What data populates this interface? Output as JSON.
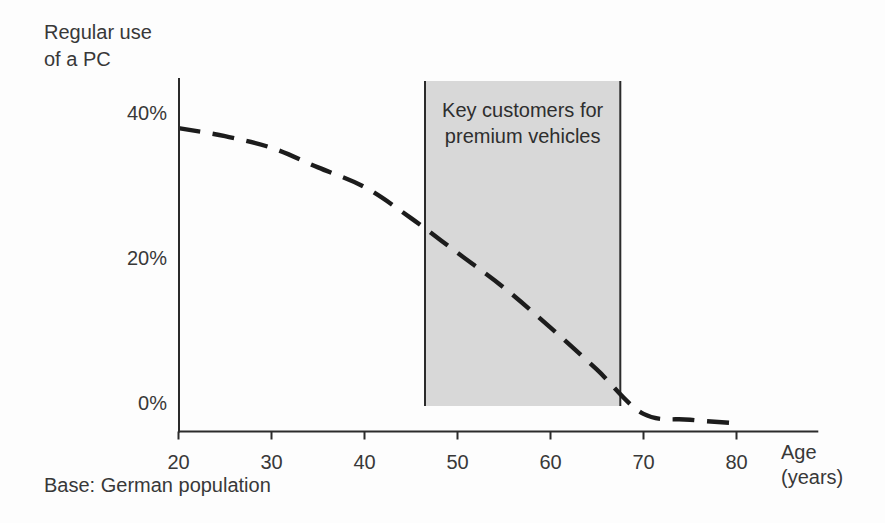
{
  "texts": {
    "y_axis_title": "Regular use\nof a PC",
    "x_axis_title": "Age\n(years)",
    "band_label": "Key customers for\npremium vehicles",
    "base_note": "Base: German population"
  },
  "colors": {
    "background": "#fdfdfd",
    "text": "#383838",
    "axis": "#2b2b2b",
    "curve": "#1c1c1c",
    "band_fill": "#d8d8d8",
    "band_border": "#2b2b2b"
  },
  "chart_data": {
    "type": "line",
    "ylabel": "Regular use of a PC",
    "xlabel": "Age (years)",
    "x_ticks": [
      20,
      30,
      40,
      50,
      60,
      70,
      80
    ],
    "y_ticks": [
      {
        "value": 40,
        "label": "40%"
      },
      {
        "value": 20,
        "label": "20%"
      },
      {
        "value": 0,
        "label": "0%"
      }
    ],
    "xlim": [
      20,
      88.8
    ],
    "ylim": [
      -3.9,
      44.8
    ],
    "grid": false,
    "legend": false,
    "series": [
      {
        "name": "Regular use of a PC (share of German population)",
        "style": "dashed",
        "x": [
          20,
          25,
          30,
          35,
          40,
          45,
          50,
          55,
          60,
          65,
          70,
          75,
          80
        ],
        "y": [
          37.9,
          36.8,
          35.2,
          32.5,
          29.8,
          25.5,
          20.7,
          15.9,
          10.4,
          4.6,
          -1.5,
          -2.3,
          -2.8
        ]
      }
    ],
    "highlight_band": {
      "label": "Key customers for premium vehicles",
      "x_from": 46.5,
      "x_to": 67.5
    }
  }
}
